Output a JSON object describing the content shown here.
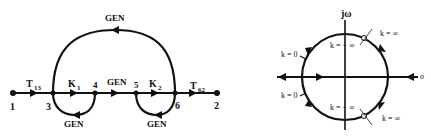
{
  "left_diagram": {
    "title": "signal-flow-graph",
    "nodes": [
      {
        "id": "1",
        "label": "1"
      },
      {
        "id": "3",
        "label": "3"
      },
      {
        "id": "4",
        "label": "4"
      },
      {
        "id": "5",
        "label": "5"
      },
      {
        "id": "6",
        "label": "6"
      },
      {
        "id": "2",
        "label": "2"
      }
    ],
    "branches": {
      "t13": {
        "main": "T",
        "sub": "13"
      },
      "k1": {
        "main": "K",
        "sub": "1"
      },
      "gen_mid": "GEN",
      "k2": {
        "main": "K",
        "sub": "2"
      },
      "t62": {
        "main": "T",
        "sub": "62"
      },
      "gen_top": "GEN",
      "gen_loop_left": "GEN",
      "gen_loop_right": "GEN"
    }
  },
  "right_diagram": {
    "title": "root-locus",
    "axis_imag": "jω",
    "axis_real": "σ",
    "labels": {
      "k_inf_top": "k = ∞",
      "k_neg_inf_top": "k = − ∞",
      "k_zero_top": "k = 0",
      "k_zero_bottom": "k = 0",
      "k_neg_inf_bottom": "k = − ∞",
      "k_inf_bottom": "k = ∞"
    }
  }
}
